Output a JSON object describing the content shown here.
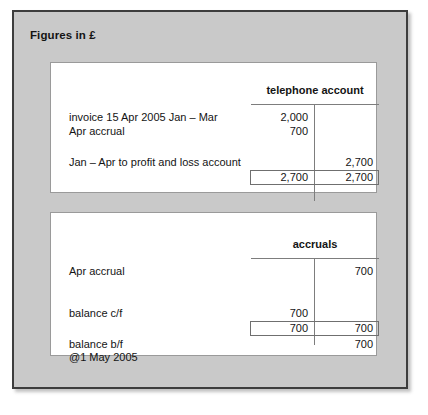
{
  "panel": {
    "title": "Figures in £",
    "background_color": "#c9c9c9",
    "border_color": "#3d3d3d"
  },
  "ledgers": [
    {
      "name": "telephone-account",
      "title": "telephone account",
      "rows": [
        {
          "label": "invoice 15 Apr 2005   Jan – Mar",
          "debit": "2,000",
          "credit": ""
        },
        {
          "label": "Apr accrual",
          "debit": "700",
          "credit": ""
        },
        {
          "label": "Jan – Apr to profit and loss account",
          "debit": "",
          "credit": "2,700"
        }
      ],
      "totals": {
        "debit": "2,700",
        "credit": "2,700"
      }
    },
    {
      "name": "accruals-account",
      "title": "accruals",
      "rows": [
        {
          "label": "Apr accrual",
          "debit": "",
          "credit": "700"
        },
        {
          "label": "balance c/f",
          "debit": "700",
          "credit": ""
        }
      ],
      "totals": {
        "debit": "700",
        "credit": "700"
      },
      "after_total_row": {
        "label_line1": "balance b/f",
        "label_line2": "@1 May 2005",
        "debit": "",
        "credit": "700"
      }
    }
  ]
}
